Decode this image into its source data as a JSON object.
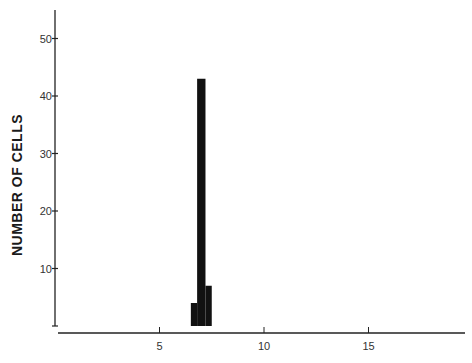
{
  "chart_data": {
    "type": "bar",
    "title": "",
    "xlabel": "",
    "ylabel": "NUMBER OF CELLS",
    "xlim": [
      0,
      19.5
    ],
    "ylim": [
      0,
      55
    ],
    "x_ticks": [
      5,
      10,
      15
    ],
    "y_ticks": [
      10,
      20,
      30,
      40,
      50
    ],
    "grid": false,
    "legend": null,
    "bins": [
      {
        "x_start": 6.5,
        "x_end": 6.8,
        "value": 4
      },
      {
        "x_start": 6.8,
        "x_end": 7.2,
        "value": 43
      },
      {
        "x_start": 7.2,
        "x_end": 7.5,
        "value": 7
      }
    ],
    "bar_color": "#111111"
  },
  "layout": {
    "y_axis_x": 55,
    "y_axis_top": 10,
    "y_zero_px": 326,
    "px_per_y_unit": 5.75,
    "x_axis_y": 333,
    "x_axis_left": 58,
    "x_axis_right": 465,
    "x_zero_px": 55,
    "px_per_x_unit": 20.9
  }
}
